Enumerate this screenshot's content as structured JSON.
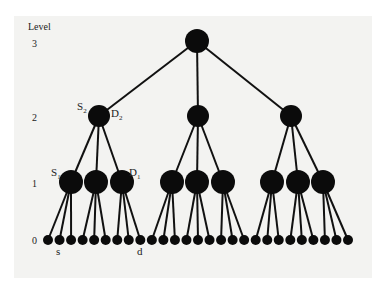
{
  "figure": {
    "axis_title": "Level",
    "levels": [
      {
        "label": "3",
        "y": 47
      },
      {
        "label": "2",
        "y": 121
      },
      {
        "label": "1",
        "y": 187
      },
      {
        "label": "0",
        "y": 244
      }
    ],
    "tree": {
      "branching": 3,
      "root": {
        "x": 197,
        "y": 41,
        "r": 12
      },
      "level2": [
        {
          "x": 99,
          "y": 116,
          "r": 11
        },
        {
          "x": 198,
          "y": 116,
          "r": 11
        },
        {
          "x": 291,
          "y": 116,
          "r": 11
        }
      ],
      "level1": [
        {
          "x": 71,
          "y": 182,
          "r": 12
        },
        {
          "x": 96,
          "y": 182,
          "r": 12
        },
        {
          "x": 122,
          "y": 182,
          "r": 12
        },
        {
          "x": 172,
          "y": 182,
          "r": 12
        },
        {
          "x": 197,
          "y": 182,
          "r": 12
        },
        {
          "x": 223,
          "y": 182,
          "r": 12
        },
        {
          "x": 272,
          "y": 182,
          "r": 12
        },
        {
          "x": 298,
          "y": 182,
          "r": 12
        },
        {
          "x": 323,
          "y": 182,
          "r": 12
        }
      ],
      "leaves": {
        "count": 27,
        "x_start": 48,
        "x_end": 348,
        "y": 240,
        "r": 5
      }
    },
    "node_labels": [
      {
        "main": "S",
        "sub": "2",
        "x": 77,
        "y": 110
      },
      {
        "main": "D",
        "sub": "2",
        "x": 111,
        "y": 117
      },
      {
        "main": "S",
        "sub": "1",
        "x": 51,
        "y": 176
      },
      {
        "main": "D",
        "sub": "1",
        "x": 129,
        "y": 176
      },
      {
        "main": "s",
        "sub": "",
        "x": 56,
        "y": 255
      },
      {
        "main": "d",
        "sub": "",
        "x": 137,
        "y": 255
      }
    ],
    "colors": {
      "node": "#0b0b0b",
      "edge": "#111111",
      "paper": "#f3f3f1"
    }
  }
}
